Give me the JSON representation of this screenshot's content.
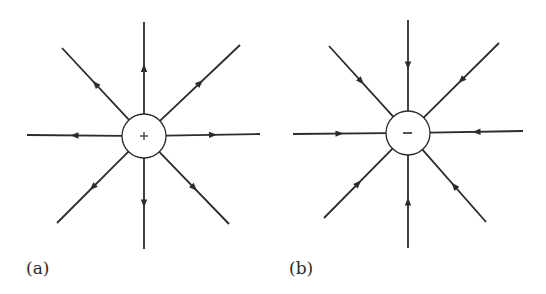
{
  "panels": [
    {
      "id": "a",
      "label": "(a)",
      "charge_sign": "+",
      "field_direction": "outward",
      "center": [
        144,
        136
      ],
      "radius": 22,
      "label_pos": [
        26,
        257
      ],
      "endpoints": [
        [
          144,
          22
        ],
        [
          240,
          45
        ],
        [
          260,
          134
        ],
        [
          229,
          224
        ],
        [
          144,
          249
        ],
        [
          57,
          223
        ],
        [
          27,
          135
        ],
        [
          62,
          48
        ]
      ]
    },
    {
      "id": "b",
      "label": "(b)",
      "charge_sign": "−",
      "field_direction": "inward",
      "center": [
        408,
        133
      ],
      "radius": 22,
      "label_pos": [
        288,
        257
      ],
      "endpoints": [
        [
          408,
          20
        ],
        [
          499,
          43
        ],
        [
          523,
          131
        ],
        [
          486,
          222
        ],
        [
          408,
          248
        ],
        [
          324,
          218
        ],
        [
          293,
          134
        ],
        [
          329,
          46
        ]
      ]
    }
  ],
  "colors": {
    "line": "#2b2b2b",
    "background": "#ffffff"
  }
}
